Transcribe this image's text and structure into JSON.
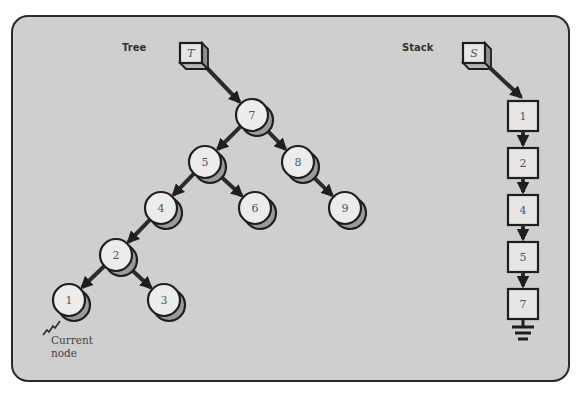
{
  "tree": {
    "title": "Tree",
    "root_pointer": {
      "label": "T",
      "x": 180,
      "y": 43
    },
    "nodes": [
      {
        "id": "7",
        "label": "7",
        "x": 252,
        "y": 115
      },
      {
        "id": "5",
        "label": "5",
        "x": 205,
        "y": 162
      },
      {
        "id": "8",
        "label": "8",
        "x": 298,
        "y": 162
      },
      {
        "id": "4",
        "label": "4",
        "x": 161,
        "y": 208
      },
      {
        "id": "6",
        "label": "6",
        "x": 255,
        "y": 208
      },
      {
        "id": "9",
        "label": "9",
        "x": 345,
        "y": 208
      },
      {
        "id": "2",
        "label": "2",
        "x": 116,
        "y": 255
      },
      {
        "id": "1",
        "label": "1",
        "x": 69,
        "y": 300
      },
      {
        "id": "3",
        "label": "3",
        "x": 164,
        "y": 300
      }
    ],
    "edges": [
      [
        "T",
        "7"
      ],
      [
        "7",
        "5"
      ],
      [
        "7",
        "8"
      ],
      [
        "5",
        "4"
      ],
      [
        "5",
        "6"
      ],
      [
        "8",
        "9"
      ],
      [
        "4",
        "2"
      ],
      [
        "2",
        "1"
      ],
      [
        "2",
        "3"
      ]
    ],
    "current_node": {
      "node": "1",
      "label_line1": "Current",
      "label_line2": "node"
    }
  },
  "stack": {
    "title": "Stack",
    "top_pointer": {
      "label": "S",
      "x": 463,
      "y": 43
    },
    "items": [
      "1",
      "2",
      "4",
      "5",
      "7"
    ],
    "column_x": 508,
    "first_y": 101,
    "spacing": 47,
    "terminator": "ground-symbol"
  },
  "colors": {
    "background": "#cfcfcf",
    "outline": "#1e1e1e",
    "node_face": "#ececec",
    "node_shadow": "#9a9a9a"
  }
}
